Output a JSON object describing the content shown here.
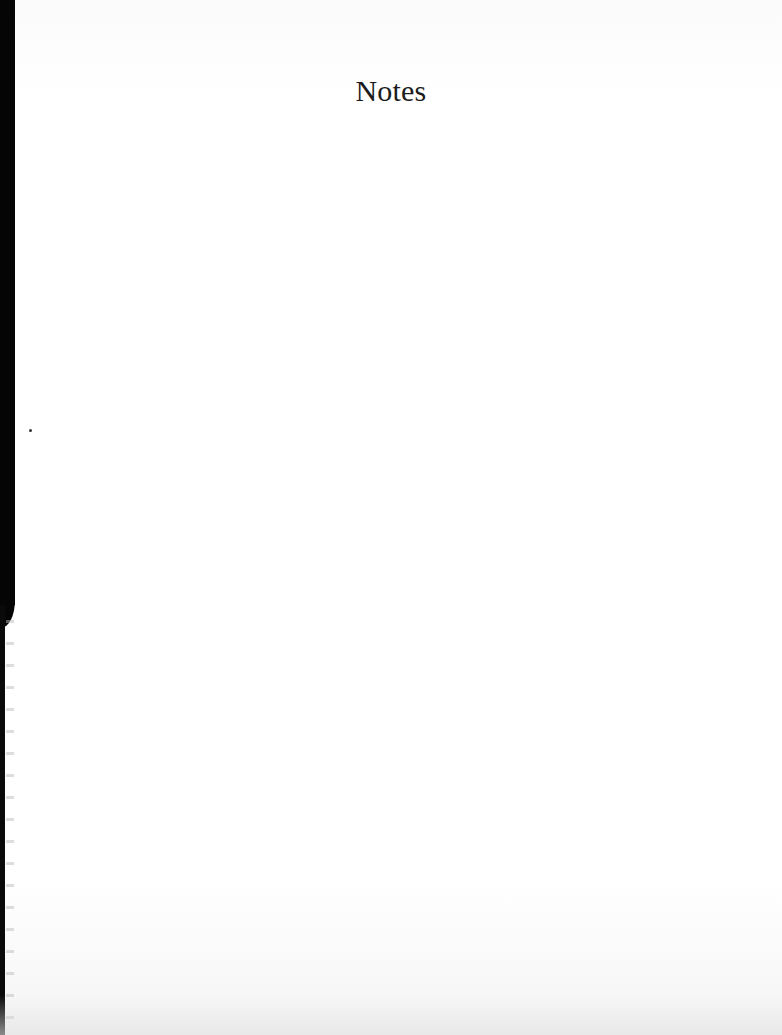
{
  "page": {
    "title": "Notes",
    "body_text": "",
    "background_color": "#ffffff",
    "binding_edge_color": "#050505"
  }
}
